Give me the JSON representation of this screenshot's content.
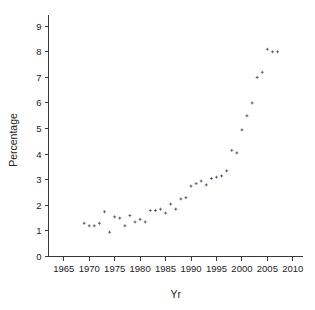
{
  "chart_data": {
    "type": "scatter",
    "title": "",
    "xlabel": "Yr",
    "ylabel": "Percentage",
    "xlim": [
      1962,
      2012
    ],
    "ylim": [
      0,
      9.4
    ],
    "xticks": [
      1965,
      1970,
      1975,
      1980,
      1985,
      1990,
      1995,
      2000,
      2005,
      2010
    ],
    "yticks": [
      0,
      1,
      2,
      3,
      4,
      5,
      6,
      7,
      8,
      9
    ],
    "grid": false,
    "legend": null,
    "marker": "point",
    "marker_color": "#5a5a6e",
    "x": [
      1969,
      1970,
      1971,
      1972,
      1973,
      1974,
      1975,
      1976,
      1977,
      1978,
      1979,
      1980,
      1981,
      1982,
      1983,
      1984,
      1985,
      1986,
      1987,
      1988,
      1989,
      1990,
      1991,
      1992,
      1993,
      1994,
      1995,
      1996,
      1997,
      1998,
      1999,
      2000,
      2001,
      2002,
      2003,
      2004,
      2005,
      2006,
      2007
    ],
    "y": [
      1.3,
      1.2,
      1.2,
      1.3,
      1.75,
      0.95,
      1.55,
      1.5,
      1.2,
      1.6,
      1.35,
      1.45,
      1.35,
      1.8,
      1.8,
      1.85,
      1.7,
      2.05,
      1.85,
      2.25,
      2.3,
      2.75,
      2.85,
      2.95,
      2.8,
      3.05,
      3.1,
      3.15,
      3.35,
      4.15,
      4.05,
      4.95,
      5.5,
      6.0,
      7.0,
      7.2,
      8.1,
      8.0,
      8.0
    ],
    "points": [
      {
        "x": 1969,
        "y": 1.3
      },
      {
        "x": 1970,
        "y": 1.2
      },
      {
        "x": 1971,
        "y": 1.2
      },
      {
        "x": 1972,
        "y": 1.3
      },
      {
        "x": 1973,
        "y": 1.75
      },
      {
        "x": 1974,
        "y": 0.95
      },
      {
        "x": 1975,
        "y": 1.55
      },
      {
        "x": 1976,
        "y": 1.5
      },
      {
        "x": 1977,
        "y": 1.2
      },
      {
        "x": 1978,
        "y": 1.6
      },
      {
        "x": 1979,
        "y": 1.35
      },
      {
        "x": 1980,
        "y": 1.45
      },
      {
        "x": 1981,
        "y": 1.35
      },
      {
        "x": 1982,
        "y": 1.8
      },
      {
        "x": 1983,
        "y": 1.8
      },
      {
        "x": 1984,
        "y": 1.85
      },
      {
        "x": 1985,
        "y": 1.7
      },
      {
        "x": 1986,
        "y": 2.05
      },
      {
        "x": 1987,
        "y": 1.85
      },
      {
        "x": 1988,
        "y": 2.25
      },
      {
        "x": 1989,
        "y": 2.3
      },
      {
        "x": 1990,
        "y": 2.75
      },
      {
        "x": 1991,
        "y": 2.85
      },
      {
        "x": 1992,
        "y": 2.95
      },
      {
        "x": 1993,
        "y": 2.8
      },
      {
        "x": 1994,
        "y": 3.05
      },
      {
        "x": 1995,
        "y": 3.1
      },
      {
        "x": 1996,
        "y": 3.15
      },
      {
        "x": 1997,
        "y": 3.35
      },
      {
        "x": 1998,
        "y": 4.15
      },
      {
        "x": 1999,
        "y": 4.05
      },
      {
        "x": 2000,
        "y": 4.95
      },
      {
        "x": 2001,
        "y": 5.5
      },
      {
        "x": 2002,
        "y": 6.0
      },
      {
        "x": 2003,
        "y": 7.0
      },
      {
        "x": 2004,
        "y": 7.2
      },
      {
        "x": 2005,
        "y": 8.1
      },
      {
        "x": 2006,
        "y": 8.0
      },
      {
        "x": 2007,
        "y": 8.0
      }
    ]
  }
}
